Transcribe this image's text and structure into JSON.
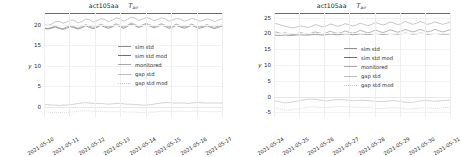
{
  "figure": {
    "width": 455,
    "height": 151,
    "background": "#ffffff"
  },
  "chart_data": [
    {
      "type": "line",
      "panel": "left",
      "title": "act105aa",
      "title_symbol": "T",
      "title_subscript": "air",
      "xlabel": "",
      "ylabel": "y",
      "xlim": [
        "2021-05-10",
        "2021-05-17"
      ],
      "ylim": [
        -2.5,
        22.8
      ],
      "yticks": [
        "0",
        "5",
        "10",
        "15",
        "20"
      ],
      "ytick_values": [
        0,
        5,
        10,
        15,
        20
      ],
      "xticks": [
        "2021-05-10",
        "2021-05-11",
        "2021-05-12",
        "2021-05-13",
        "2021-05-14",
        "2021-05-15",
        "2021-05-16",
        "2021-05-17"
      ],
      "grid": true,
      "legend_position": "center-right",
      "series": [
        {
          "name": "sim std",
          "color": "#8f8f8f",
          "style": "solid",
          "values": [
            19.2,
            19.0,
            19.3,
            19.6,
            19.2,
            19.0,
            19.4,
            19.8,
            19.4,
            19.1,
            19.5,
            20.0,
            19.6,
            19.3,
            19.6,
            20.1,
            19.7,
            19.4,
            19.7,
            20.2,
            19.8,
            19.4,
            19.8,
            20.4,
            20.0,
            19.6,
            19.9,
            20.3,
            19.9,
            19.5,
            19.8,
            20.2,
            19.8,
            19.4,
            19.7,
            20.1,
            19.7,
            19.4,
            19.7,
            20.1,
            19.7,
            19.4,
            19.6,
            20.0,
            19.6,
            19.3,
            19.6,
            19.9
          ]
        },
        {
          "name": "sim std mod",
          "color": "#6e6e6e",
          "style": "solid",
          "values": [
            19.1,
            18.9,
            19.1,
            19.4,
            19.0,
            18.8,
            19.1,
            19.5,
            19.2,
            18.9,
            19.2,
            19.7,
            19.3,
            19.0,
            19.3,
            19.8,
            19.4,
            19.1,
            19.4,
            19.9,
            19.5,
            19.1,
            19.5,
            20.1,
            19.7,
            19.3,
            19.6,
            20.0,
            19.6,
            19.2,
            19.5,
            19.9,
            19.5,
            19.1,
            19.4,
            19.8,
            19.4,
            19.1,
            19.4,
            19.8,
            19.4,
            19.1,
            19.3,
            19.7,
            19.3,
            19.0,
            19.3,
            19.6
          ]
        },
        {
          "name": "monitored",
          "color": "#a8a8a8",
          "style": "solid",
          "values": [
            20.0,
            19.8,
            20.1,
            20.7,
            20.8,
            20.3,
            20.6,
            21.1,
            21.0,
            20.4,
            20.7,
            21.3,
            21.2,
            20.6,
            20.9,
            21.4,
            21.3,
            20.7,
            21.0,
            21.6,
            21.4,
            20.8,
            21.2,
            21.8,
            21.6,
            21.0,
            21.3,
            21.7,
            21.5,
            20.9,
            21.2,
            21.6,
            21.4,
            20.8,
            21.1,
            21.5,
            21.3,
            20.8,
            21.1,
            21.5,
            21.3,
            20.8,
            21.0,
            21.4,
            21.2,
            20.7,
            21.0,
            21.4
          ]
        },
        {
          "name": "gap std",
          "color": "#bdbdbd",
          "style": "solid",
          "values": [
            0.5,
            0.5,
            0.4,
            0.4,
            0.3,
            0.4,
            0.4,
            0.5,
            0.6,
            0.8,
            0.9,
            1.0,
            0.9,
            0.8,
            0.8,
            0.8,
            0.7,
            0.6,
            0.7,
            0.8,
            0.8,
            0.7,
            0.6,
            0.6,
            0.5,
            0.5,
            0.4,
            0.4,
            0.5,
            0.6,
            0.8,
            0.9,
            1.0,
            1.0,
            0.9,
            0.9,
            0.9,
            0.9,
            0.8,
            0.9,
            1.0,
            1.0,
            0.9,
            0.9,
            0.9,
            0.9,
            0.9,
            0.9
          ]
        },
        {
          "name": "gap std mod",
          "color": "#c8c8c8",
          "style": "dotted",
          "values": [
            -1.2,
            -1.3,
            -1.4,
            -1.4,
            -1.5,
            -1.4,
            -1.4,
            -1.3,
            -1.2,
            -1.1,
            -1.0,
            -1.0,
            -1.0,
            -1.1,
            -1.1,
            -1.1,
            -1.2,
            -1.2,
            -1.2,
            -1.2,
            -1.2,
            -1.2,
            -1.3,
            -1.3,
            -1.3,
            -1.4,
            -1.4,
            -1.4,
            -1.3,
            -1.3,
            -1.2,
            -1.1,
            -1.1,
            -1.1,
            -1.1,
            -1.1,
            -1.1,
            -1.1,
            -1.2,
            -1.1,
            -1.1,
            -1.1,
            -1.1,
            -1.2,
            -1.2,
            -1.2,
            -1.2,
            -1.2
          ]
        }
      ]
    },
    {
      "type": "line",
      "panel": "right",
      "title": "act105aa",
      "title_symbol": "T",
      "title_subscript": "air",
      "xlabel": "",
      "ylabel": "y",
      "xlim": [
        "2021-05-24",
        "2021-05-31"
      ],
      "ylim": [
        -6.5,
        26.5
      ],
      "yticks": [
        "-5",
        "0",
        "5",
        "10",
        "15",
        "20",
        "25"
      ],
      "ytick_values": [
        -5,
        0,
        5,
        10,
        15,
        20,
        25
      ],
      "xticks": [
        "2021-05-24",
        "2021-05-25",
        "2021-05-26",
        "2021-05-27",
        "2021-05-28",
        "2021-05-29",
        "2021-05-30",
        "2021-05-31"
      ],
      "grid": true,
      "legend_position": "center-right",
      "series": [
        {
          "name": "sim std",
          "color": "#8f8f8f",
          "style": "solid",
          "values": [
            20.6,
            20.3,
            20.0,
            20.2,
            19.9,
            19.7,
            19.9,
            20.3,
            20.0,
            19.8,
            20.1,
            20.5,
            20.2,
            19.9,
            20.2,
            20.7,
            20.3,
            20.0,
            20.3,
            20.8,
            20.4,
            20.1,
            20.4,
            21.0,
            20.6,
            20.2,
            20.5,
            21.1,
            20.7,
            20.3,
            20.6,
            21.2,
            20.8,
            20.4,
            20.7,
            21.3,
            20.9,
            20.5,
            20.8,
            21.3,
            20.9,
            20.5,
            20.8,
            21.3,
            20.9,
            20.5,
            20.8,
            21.2
          ]
        },
        {
          "name": "sim std mod",
          "color": "#6e6e6e",
          "style": "solid",
          "values": [
            19.5,
            19.4,
            19.4,
            19.5,
            19.4,
            19.4,
            19.5,
            19.6,
            19.5,
            19.5,
            19.6,
            19.7,
            19.6,
            19.5,
            19.6,
            19.8,
            19.7,
            19.6,
            19.7,
            19.9,
            19.8,
            19.6,
            19.7,
            19.9,
            19.8,
            19.7,
            19.8,
            20.0,
            19.9,
            19.7,
            19.8,
            20.0,
            19.9,
            19.8,
            19.9,
            20.1,
            20.0,
            19.8,
            19.9,
            20.1,
            20.0,
            19.8,
            19.9,
            20.0,
            19.9,
            19.8,
            19.8,
            19.9
          ]
        },
        {
          "name": "monitored",
          "color": "#a8a8a8",
          "style": "solid",
          "values": [
            23.2,
            23.0,
            22.6,
            22.3,
            22.0,
            21.8,
            22.0,
            22.4,
            22.2,
            21.9,
            22.2,
            22.8,
            22.5,
            22.1,
            22.4,
            23.0,
            22.7,
            22.3,
            22.6,
            23.1,
            22.8,
            22.4,
            22.7,
            23.3,
            22.9,
            22.5,
            22.8,
            23.5,
            23.1,
            22.7,
            23.0,
            23.7,
            23.3,
            22.8,
            23.1,
            23.8,
            23.4,
            22.9,
            23.2,
            23.8,
            23.4,
            22.9,
            23.2,
            23.7,
            23.3,
            22.9,
            23.2,
            23.6
          ]
        },
        {
          "name": "gap std",
          "color": "#bdbdbd",
          "style": "solid",
          "values": [
            -1.3,
            -1.5,
            -1.8,
            -2.0,
            -1.9,
            -1.7,
            -1.5,
            -1.3,
            -1.1,
            -0.9,
            -0.8,
            -0.9,
            -1.1,
            -1.3,
            -1.4,
            -1.3,
            -1.1,
            -1.0,
            -1.0,
            -1.1,
            -1.2,
            -1.3,
            -1.3,
            -1.2,
            -1.2,
            -1.3,
            -1.4,
            -1.5,
            -1.6,
            -1.6,
            -1.5,
            -1.4,
            -1.3,
            -1.4,
            -1.6,
            -1.8,
            -1.9,
            -1.8,
            -1.6,
            -1.4,
            -1.3,
            -1.3,
            -1.4,
            -1.5,
            -1.4,
            -1.3,
            -1.2,
            -1.1
          ]
        },
        {
          "name": "gap std mod",
          "color": "#c8c8c8",
          "style": "dotted",
          "values": [
            -3.7,
            -3.9,
            -4.1,
            -4.3,
            -4.3,
            -4.2,
            -4.0,
            -3.8,
            -3.6,
            -3.4,
            -3.3,
            -3.3,
            -3.4,
            -3.5,
            -3.5,
            -3.4,
            -3.3,
            -3.2,
            -3.2,
            -3.2,
            -3.3,
            -3.3,
            -3.4,
            -3.4,
            -3.4,
            -3.5,
            -3.6,
            -3.7,
            -3.8,
            -3.8,
            -3.7,
            -3.6,
            -3.5,
            -3.6,
            -3.7,
            -3.9,
            -4.0,
            -3.9,
            -3.8,
            -3.7,
            -3.6,
            -3.6,
            -3.7,
            -3.8,
            -3.7,
            -3.6,
            -3.5,
            -3.4
          ]
        }
      ]
    }
  ],
  "legend": {
    "items": [
      {
        "label": "sim std",
        "color": "#8f8f8f",
        "style": "solid"
      },
      {
        "label": "sim std mod",
        "color": "#6e6e6e",
        "style": "solid"
      },
      {
        "label": "monitored",
        "color": "#a8a8a8",
        "style": "solid"
      },
      {
        "label": "gap std",
        "color": "#bdbdbd",
        "style": "solid"
      },
      {
        "label": "gap std mod",
        "color": "#c8c8c8",
        "style": "dotted"
      }
    ]
  }
}
